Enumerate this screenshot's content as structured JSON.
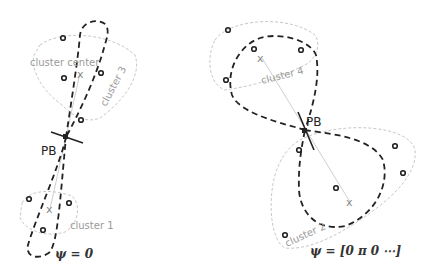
{
  "left_panel": {
    "labels": {
      "cluster_center": "cluster center",
      "cluster3": "cluster 3",
      "cluster1": "cluster 1",
      "pb": "PB",
      "psi": "ψ = 0"
    }
  },
  "right_panel": {
    "labels": {
      "cluster4": "cluster 4",
      "cluster2": "cluster 2",
      "pb": "PB",
      "psi": "ψ = [0 π 0 ⋯]"
    }
  },
  "markers": {
    "center_symbol": "x"
  },
  "colors": {
    "dashed_curve": "#222222",
    "cluster_boundary": "#c8c8c8",
    "label_gray": "#9a9a9a"
  }
}
